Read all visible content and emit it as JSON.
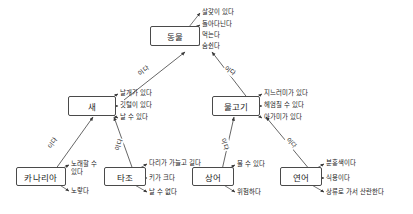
{
  "diagram": {
    "title": "",
    "link_label": "이다",
    "nodes": {
      "animal": "동물",
      "bird": "새",
      "fish": "물고기",
      "canary": "카나리아",
      "ostrich": "타조",
      "shark": "상어",
      "salmon": "연어"
    },
    "properties": {
      "animal": [
        "살갗이 있다",
        "돌아다닌다",
        "먹는다",
        "숨쉰다"
      ],
      "bird": [
        "날개가 있다",
        "깃털이 있다",
        "날 수 있다"
      ],
      "fish": [
        "지느러미가 있다",
        "헤엄칠 수 있다",
        "아가미가 있다"
      ],
      "canary": [
        "노래할 수 있다",
        "노랗다"
      ],
      "ostrich": [
        "다리가 가늘고 길다",
        "키가 크다",
        "날 수 없다"
      ],
      "shark": [
        "물 수 있다",
        "위험하다"
      ],
      "salmon": [
        "분홍색이다",
        "식용이다",
        "상류로 가서 산란한다"
      ]
    },
    "links": [
      {
        "from": "bird",
        "to": "animal",
        "label": "이다"
      },
      {
        "from": "fish",
        "to": "animal",
        "label": "이다"
      },
      {
        "from": "canary",
        "to": "bird",
        "label": "이다"
      },
      {
        "from": "ostrich",
        "to": "bird",
        "label": "이다"
      },
      {
        "from": "shark",
        "to": "fish",
        "label": "이다"
      },
      {
        "from": "salmon",
        "to": "fish",
        "label": "이다"
      }
    ],
    "colors": {
      "node_border": "#4a4a4a",
      "edge": "#555555",
      "text": "#1a1a1a",
      "background": "#ffffff"
    }
  }
}
